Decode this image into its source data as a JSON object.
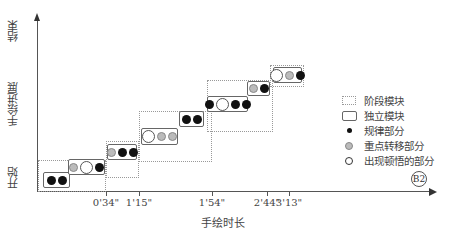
{
  "axes": {
    "y_label": "手绘进展",
    "y_start_label": "开始",
    "y_end_label": "结束",
    "x_label": "手绘时长",
    "x_ticks": [
      {
        "label": "0'34\"",
        "x": 106
      },
      {
        "label": "1'15\"",
        "x": 139
      },
      {
        "label": "1'54\"",
        "x": 212
      },
      {
        "label": "2'44\"",
        "x": 267
      },
      {
        "label": "3'13\"",
        "x": 289
      }
    ]
  },
  "stages": [
    {
      "id": "stage-1",
      "x": 38,
      "y": 160,
      "w": 68,
      "h": 32
    },
    {
      "id": "stage-2",
      "x": 106,
      "y": 141,
      "w": 33,
      "h": 37
    },
    {
      "id": "stage-3",
      "x": 139,
      "y": 111,
      "w": 73,
      "h": 51
    },
    {
      "id": "stage-4",
      "x": 207,
      "y": 80,
      "w": 66,
      "h": 52
    },
    {
      "id": "stage-5",
      "x": 270,
      "y": 65,
      "w": 34,
      "h": 22
    }
  ],
  "modules": [
    {
      "id": "module-1",
      "x": 43,
      "y": 172,
      "w": 27,
      "h": 16,
      "dots": [
        "black",
        "black"
      ]
    },
    {
      "id": "module-2",
      "x": 68,
      "y": 159,
      "w": 37,
      "h": 16,
      "dots": [
        "gray",
        "open",
        "black"
      ]
    },
    {
      "id": "module-3",
      "x": 107,
      "y": 144,
      "w": 30,
      "h": 16,
      "dots": [
        "gray",
        "black",
        "black"
      ]
    },
    {
      "id": "module-4",
      "x": 141,
      "y": 128,
      "w": 37,
      "h": 17,
      "dots": [
        "open",
        "gray",
        "gray"
      ]
    },
    {
      "id": "module-5",
      "x": 179,
      "y": 111,
      "w": 25,
      "h": 16,
      "dots": [
        "black",
        "black"
      ]
    },
    {
      "id": "module-6",
      "x": 207,
      "y": 96,
      "w": 41,
      "h": 16,
      "dots": [
        "black",
        "open",
        "black",
        "black"
      ]
    },
    {
      "id": "module-7",
      "x": 247,
      "y": 81,
      "w": 23,
      "h": 15,
      "dots": [
        "gray",
        "black"
      ]
    },
    {
      "id": "module-8",
      "x": 273,
      "y": 67,
      "w": 29,
      "h": 16,
      "dots": [
        "open",
        "gray",
        "black"
      ]
    }
  ],
  "legend": {
    "items": [
      {
        "symbol": "stage",
        "label": "阶段模块"
      },
      {
        "symbol": "box",
        "label": "独立模块"
      },
      {
        "symbol": "black",
        "label": "规律部分"
      },
      {
        "symbol": "gray",
        "label": "重点转移部分"
      },
      {
        "symbol": "open",
        "label": "出现顿悟的部分"
      }
    ]
  },
  "badge": "B2"
}
